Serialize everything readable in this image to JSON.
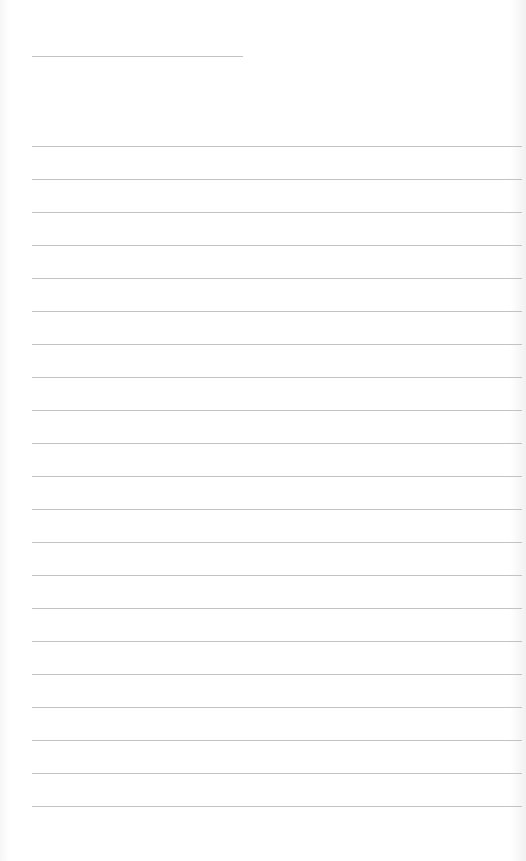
{
  "page": {
    "type": "blank-lined-sheet",
    "line_color": "#b9b9b9",
    "background": "#ffffff",
    "title_line": {
      "x": 32,
      "y": 56,
      "width": 211
    },
    "writing_lines": {
      "count": 21,
      "first_y": 146,
      "spacing": 33,
      "x": 32,
      "width": 490
    }
  }
}
